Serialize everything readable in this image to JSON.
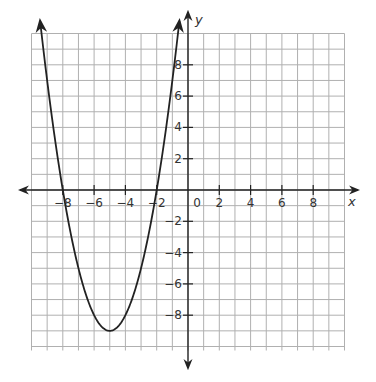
{
  "chart_data": {
    "type": "line",
    "title": "",
    "xlabel": "x",
    "ylabel": "y",
    "xlim": [
      -10,
      10
    ],
    "ylim": [
      -10,
      10
    ],
    "grid": true,
    "grid_step": 1,
    "x_ticks": [
      -8,
      -6,
      -4,
      -2,
      0,
      2,
      4,
      6,
      8
    ],
    "x_tick_labels": [
      "-8",
      "-6",
      "-4",
      "-2",
      "0",
      "2",
      "4",
      "6",
      "8"
    ],
    "y_ticks": [
      8,
      6,
      4,
      2,
      -2,
      -4,
      -6,
      -8
    ],
    "y_tick_labels": [
      "8",
      "6",
      "4",
      "2",
      "-2",
      "-4",
      "-6",
      "-8"
    ],
    "series": [
      {
        "name": "parabola",
        "equation": "y = (x + 8)(x + 2)",
        "roots": [
          -8,
          -2
        ],
        "vertex": [
          -5,
          -9
        ],
        "x_range": [
          -9.45,
          -0.55
        ],
        "arrows_at_ends": true,
        "points": [
          {
            "x": -9.4,
            "y": 10.4
          },
          {
            "x": -9,
            "y": 7
          },
          {
            "x": -8,
            "y": 0
          },
          {
            "x": -7,
            "y": -5
          },
          {
            "x": -6,
            "y": -8
          },
          {
            "x": -5,
            "y": -9
          },
          {
            "x": -4,
            "y": -8
          },
          {
            "x": -3,
            "y": -5
          },
          {
            "x": -2,
            "y": 0
          },
          {
            "x": -1,
            "y": 7
          },
          {
            "x": -0.6,
            "y": 10.4
          }
        ]
      }
    ]
  },
  "colors": {
    "grid": "#b0b0b0",
    "axis": "#222222",
    "curve": "#222222"
  }
}
